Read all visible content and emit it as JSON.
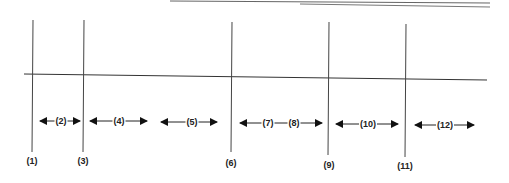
{
  "diagram": {
    "type": "line-and-interval diagram",
    "horizontal_line": {
      "x1": 24,
      "y1": 74,
      "x2": 487,
      "y2": 80
    },
    "vertical_lines": [
      {
        "id": "1",
        "label": "(1)",
        "x": 33,
        "y_top": 20,
        "y_bottom": 152
      },
      {
        "id": "3",
        "label": "(3)",
        "x": 84,
        "y_top": 20,
        "y_bottom": 152
      },
      {
        "id": "6",
        "label": "(6)",
        "x": 232,
        "y_top": 22,
        "y_bottom": 152
      },
      {
        "id": "9",
        "label": "(9)",
        "x": 329,
        "y_top": 22,
        "y_bottom": 155
      },
      {
        "id": "11",
        "label": "(11)",
        "x": 406,
        "y_top": 24,
        "y_bottom": 157
      }
    ],
    "interval_arrows": [
      {
        "labels": [
          "(2)"
        ],
        "x1": 40,
        "x2": 80,
        "y": 121
      },
      {
        "labels": [
          "(4)"
        ],
        "x1": 90,
        "x2": 147,
        "y": 121
      },
      {
        "labels": [
          "(5)"
        ],
        "x1": 161,
        "x2": 217,
        "y": 122
      },
      {
        "labels": [
          "(7)",
          "(8)"
        ],
        "x1": 240,
        "x2": 322,
        "y": 123
      },
      {
        "labels": [
          "(10)"
        ],
        "x1": 336,
        "x2": 398,
        "y": 124
      },
      {
        "labels": [
          "(12)"
        ],
        "x1": 415,
        "x2": 474,
        "y": 125
      }
    ],
    "bottom_labels": [
      {
        "text": "(1)",
        "x": 32,
        "y": 157
      },
      {
        "text": "(3)",
        "x": 83,
        "y": 157
      },
      {
        "text": "(6)",
        "x": 231,
        "y": 159
      },
      {
        "text": "(9)",
        "x": 329,
        "y": 161
      },
      {
        "text": "(11)",
        "x": 405,
        "y": 162
      }
    ],
    "arrow_labels": {
      "a2": "(2)",
      "a4": "(4)",
      "a5": "(5)",
      "a7": "(7)",
      "a8": "(8)",
      "a10": "(10)",
      "a12": "(12)"
    },
    "colors": {
      "line": "#333333",
      "scan_edge": "#555555"
    }
  }
}
